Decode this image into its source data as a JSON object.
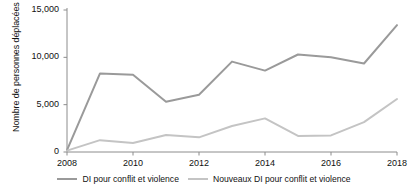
{
  "chart_data": {
    "type": "line",
    "title": "",
    "xlabel": "",
    "ylabel": "Nombre de personnes déplacées (milliers)",
    "x": [
      2008,
      2009,
      2010,
      2011,
      2012,
      2013,
      2014,
      2015,
      2016,
      2017,
      2018
    ],
    "xtick_labels": [
      "2008",
      "2010",
      "2012",
      "2014",
      "2016",
      "2018"
    ],
    "xticks": [
      2008,
      2010,
      2012,
      2014,
      2016,
      2018
    ],
    "xlim": [
      2008,
      2018
    ],
    "ytick_labels": [
      "0",
      "5,000",
      "10,000",
      "15,000"
    ],
    "yticks": [
      0,
      5000,
      10000,
      15000
    ],
    "ylim": [
      0,
      15000
    ],
    "grid": false,
    "legend_position": "bottom",
    "series": [
      {
        "name": "DI pour conflit et violence",
        "color": "#9a9a9a",
        "values": [
          200,
          8300,
          8150,
          5300,
          6050,
          9550,
          8600,
          10300,
          10000,
          9350,
          13400
        ]
      },
      {
        "name": "Nouveaux DI pour conflit et violence",
        "color": "#c4c4c4",
        "values": [
          150,
          1250,
          950,
          1800,
          1550,
          2750,
          3550,
          1700,
          1750,
          3150,
          5600
        ]
      }
    ]
  },
  "axis": {
    "line_color": "#8c8c8c"
  }
}
